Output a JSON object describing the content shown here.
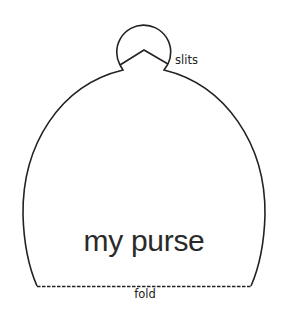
{
  "diagram": {
    "title": "my purse",
    "labels": {
      "slits": "slits",
      "fold": "fold"
    },
    "colors": {
      "stroke": "#222222",
      "background": "#ffffff"
    }
  }
}
